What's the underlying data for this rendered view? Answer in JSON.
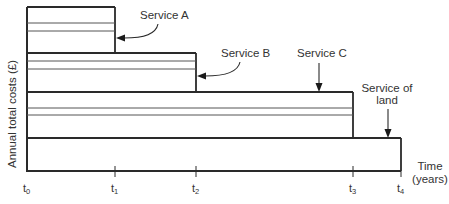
{
  "diagram": {
    "y_axis_label": "Annual total costs (£)",
    "x_axis_label_line1": "Time",
    "x_axis_label_line2": "(years)",
    "ticks": [
      {
        "base": "t",
        "sub": "0"
      },
      {
        "base": "t",
        "sub": "1"
      },
      {
        "base": "t",
        "sub": "2"
      },
      {
        "base": "t",
        "sub": "3"
      },
      {
        "base": "t",
        "sub": "4"
      }
    ],
    "services": [
      {
        "label": "Service A",
        "ends_at": "t1"
      },
      {
        "label": "Service B",
        "ends_at": "t2"
      },
      {
        "label": "Service C",
        "ends_at": "t3"
      },
      {
        "label_line1": "Service of",
        "label_line2": "land",
        "ends_at": "t4"
      }
    ],
    "colors": {
      "stroke": "#2a2a2a",
      "text": "#333333",
      "background": "#ffffff"
    }
  }
}
